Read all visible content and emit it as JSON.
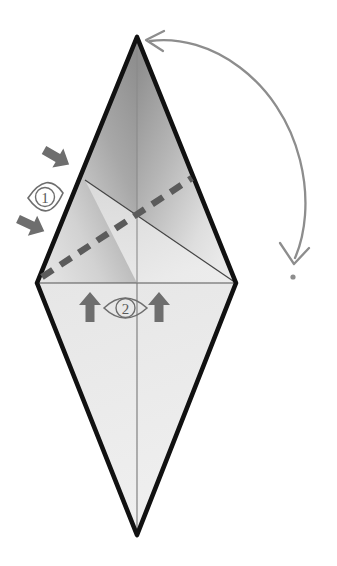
{
  "diagram": {
    "type": "origami-instruction",
    "background_color": "#ffffff",
    "outline_color": "#111111",
    "crease_color": "#3a3a3a",
    "arrow_color": "#6b6b6b",
    "curved_arrow_color": "#8a8a8a",
    "fill_light": "#e9e9e9",
    "fill_mid": "#cfcfcf",
    "fill_dark": "#8f8f8f"
  },
  "shape": {
    "name": "kite-rhombus",
    "apex_top": {
      "x": 137,
      "y": 37
    },
    "apex_bottom": {
      "x": 137,
      "y": 535
    },
    "vertex_left": {
      "x": 37,
      "y": 283
    },
    "vertex_right": {
      "x": 236,
      "y": 283
    }
  },
  "creases": {
    "horizontal_label": "horizontal crease",
    "vertical_label": "vertical center crease",
    "diagonal_label": "diagonal crease",
    "dashed_label": "valley fold line (dashed)"
  },
  "annotations": {
    "step_one": {
      "number": "1",
      "symbol": "eye-marker",
      "arrows": [
        {
          "name": "fold-arrow-upper",
          "direction": "down-right"
        },
        {
          "name": "fold-arrow-lower",
          "direction": "down-right"
        }
      ]
    },
    "step_two": {
      "number": "2",
      "symbol": "eye-marker",
      "arrows": [
        {
          "name": "push-arrow-left",
          "direction": "up"
        },
        {
          "name": "push-arrow-right",
          "direction": "up"
        }
      ]
    },
    "rotate": {
      "name": "rotate-arrow",
      "description": "curved double-headed arrow",
      "target_label": "apex"
    }
  }
}
